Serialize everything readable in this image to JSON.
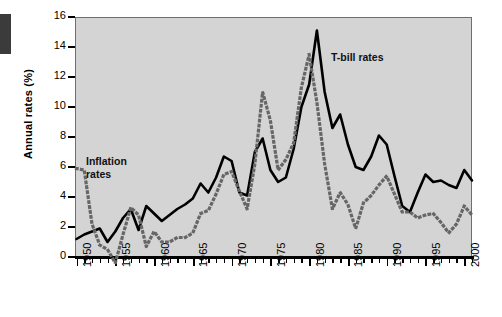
{
  "chart_data": {
    "type": "line",
    "title": "",
    "xlabel": "",
    "ylabel": "Annual rates (%)",
    "ylim": [
      0,
      16
    ],
    "xlim": [
      1950,
      2001
    ],
    "ytick_values": [
      0,
      2,
      4,
      6,
      8,
      10,
      12,
      14,
      16
    ],
    "ytick_labels": [
      "0",
      "2",
      "4",
      "6",
      "8",
      "10",
      "12",
      "14",
      "16"
    ],
    "xtick_values": [
      1950,
      1955,
      1960,
      1965,
      1970,
      1975,
      1980,
      1985,
      1990,
      1995,
      2000
    ],
    "xtick_labels": [
      "1950",
      "1955",
      "1960",
      "1965",
      "1970",
      "1975",
      "1980",
      "1985",
      "1990",
      "1995",
      "2000"
    ],
    "xtick_minor_step": 1,
    "grid": false,
    "legend": "annotations-in-plot",
    "plot_background": "#d4d4d4",
    "annotations": [
      {
        "name": "t-bill-rates",
        "text": "T-bill rates",
        "x": 1982.5,
        "y": 13.2
      },
      {
        "name": "inflation-rates",
        "text": "Inflation\nrates",
        "x": 1951.5,
        "y": 6.9
      }
    ],
    "series": [
      {
        "name": "T-bill rates",
        "style": "solid",
        "color": "#000000",
        "x": [
          1950,
          1951,
          1952,
          1953,
          1954,
          1955,
          1956,
          1957,
          1958,
          1959,
          1960,
          1961,
          1962,
          1963,
          1964,
          1965,
          1966,
          1967,
          1968,
          1969,
          1970,
          1971,
          1972,
          1973,
          1974,
          1975,
          1976,
          1977,
          1978,
          1979,
          1980,
          1981,
          1982,
          1983,
          1984,
          1985,
          1986,
          1987,
          1988,
          1989,
          1990,
          1991,
          1992,
          1993,
          1994,
          1995,
          1996,
          1997,
          1998,
          1999,
          2000,
          2001
        ],
        "values": [
          1.2,
          1.5,
          1.7,
          1.9,
          1.0,
          1.7,
          2.6,
          3.2,
          1.8,
          3.4,
          2.9,
          2.4,
          2.8,
          3.2,
          3.5,
          3.9,
          4.9,
          4.3,
          5.3,
          6.7,
          6.4,
          4.3,
          4.1,
          7.0,
          7.9,
          5.8,
          5.0,
          5.3,
          7.2,
          10.0,
          11.5,
          15.1,
          11.0,
          8.6,
          9.5,
          7.5,
          6.0,
          5.8,
          6.7,
          8.1,
          7.5,
          5.4,
          3.4,
          3.0,
          4.3,
          5.5,
          5.0,
          5.1,
          4.8,
          4.6,
          5.8,
          5.1
        ]
      },
      {
        "name": "Inflation rates",
        "style": "dotted",
        "color": "#666666",
        "x": [
          1950,
          1951,
          1952,
          1953,
          1954,
          1955,
          1956,
          1957,
          1958,
          1959,
          1960,
          1961,
          1962,
          1963,
          1964,
          1965,
          1966,
          1967,
          1968,
          1969,
          1970,
          1971,
          1972,
          1973,
          1974,
          1975,
          1976,
          1977,
          1978,
          1979,
          1980,
          1981,
          1982,
          1983,
          1984,
          1985,
          1986,
          1987,
          1988,
          1989,
          1990,
          1991,
          1992,
          1993,
          1994,
          1995,
          1996,
          1997,
          1998,
          1999,
          2000,
          2001
        ],
        "values": [
          5.9,
          5.8,
          2.2,
          0.8,
          0.5,
          -0.4,
          1.5,
          3.3,
          2.8,
          0.7,
          1.7,
          1.0,
          1.0,
          1.3,
          1.3,
          1.6,
          2.9,
          3.1,
          4.2,
          5.5,
          5.7,
          4.4,
          3.2,
          6.2,
          11.0,
          9.1,
          5.8,
          6.5,
          7.6,
          11.3,
          13.5,
          10.3,
          6.2,
          3.2,
          4.3,
          3.5,
          1.9,
          3.6,
          4.1,
          4.8,
          5.4,
          4.2,
          3.0,
          3.0,
          2.6,
          2.8,
          2.9,
          2.3,
          1.6,
          2.2,
          3.4,
          2.8
        ]
      }
    ]
  }
}
